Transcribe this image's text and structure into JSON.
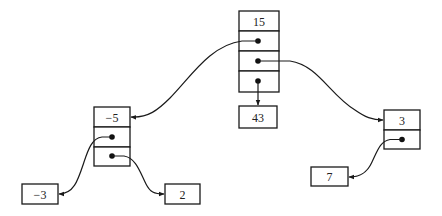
{
  "diagram": {
    "type": "tree-of-pointer-nodes",
    "nodes": [
      {
        "id": "root",
        "value": "15",
        "x": 239,
        "y": 11,
        "w": 40,
        "rowH": 20.25,
        "pointer_rows": 3
      },
      {
        "id": "left",
        "value": "−5",
        "x": 94,
        "y": 107,
        "w": 36,
        "rowH": 19.7,
        "pointer_rows": 2
      },
      {
        "id": "mid-leaf",
        "value": "43",
        "x": 239,
        "y": 106,
        "w": 38,
        "rowH": 22,
        "pointer_rows": 0
      },
      {
        "id": "right",
        "value": "3",
        "x": 384,
        "y": 110,
        "w": 36,
        "rowH": 19.5,
        "pointer_rows": 1
      },
      {
        "id": "left-left-leaf",
        "value": "−3",
        "x": 22,
        "y": 184,
        "w": 36,
        "rowH": 20,
        "pointer_rows": 0
      },
      {
        "id": "left-right-leaf",
        "value": "2",
        "x": 165,
        "y": 184,
        "w": 35,
        "rowH": 20,
        "pointer_rows": 0
      },
      {
        "id": "right-leaf",
        "value": "7",
        "x": 311,
        "y": 167,
        "w": 37,
        "rowH": 19,
        "pointer_rows": 0
      }
    ],
    "edges": [
      {
        "from": "root",
        "row": 1,
        "to": "left"
      },
      {
        "from": "root",
        "row": 2,
        "to": "right"
      },
      {
        "from": "root",
        "row": 3,
        "to": "mid-leaf"
      },
      {
        "from": "left",
        "row": 1,
        "to": "left-left-leaf"
      },
      {
        "from": "left",
        "row": 2,
        "to": "left-right-leaf"
      },
      {
        "from": "right",
        "row": 1,
        "to": "right-leaf"
      }
    ],
    "colors": {
      "stroke": "#1a1a1a",
      "fill": "#ffffff",
      "text": "#222222"
    }
  },
  "labels": {
    "root": "15",
    "left": "−5",
    "mid_leaf": "43",
    "right": "3",
    "left_left_leaf": "−3",
    "left_right_leaf": "2",
    "right_leaf": "7"
  }
}
